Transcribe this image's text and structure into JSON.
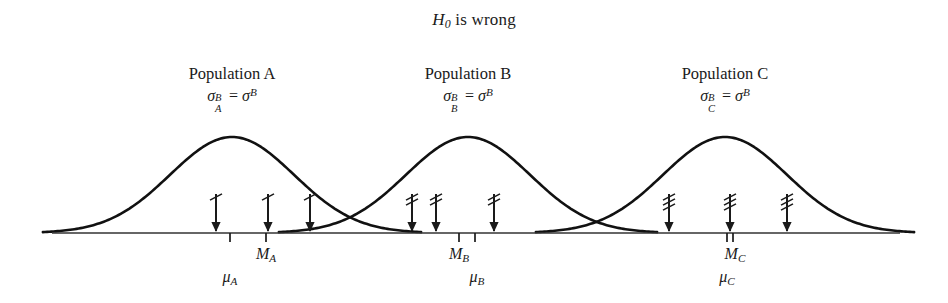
{
  "title": {
    "prefix": "H",
    "subscript": "0",
    "suffix": " is wrong"
  },
  "populations": [
    {
      "name": "Population A",
      "sigma_base": "σ",
      "sigma_sup": "B",
      "sigma_sub": "A",
      "equals": "=",
      "sigma_right_base": "σ",
      "sigma_right_sup": "B",
      "mu_label": "μ",
      "mu_sub": "A",
      "m_label": "M",
      "m_sub": "A",
      "peak_x": 232,
      "mu_x": 230,
      "m_x": 266,
      "arrow_x": [
        216,
        268,
        310
      ],
      "arrow_hatches": 1
    },
    {
      "name": "Population B",
      "sigma_base": "σ",
      "sigma_sup": "B",
      "sigma_sub": "B",
      "equals": "=",
      "sigma_right_base": "σ",
      "sigma_right_sup": "B",
      "mu_label": "μ",
      "mu_sub": "B",
      "m_label": "M",
      "m_sub": "B",
      "peak_x": 468,
      "mu_x": 475,
      "m_x": 459,
      "arrow_x": [
        412,
        436,
        494
      ],
      "arrow_hatches": 2
    },
    {
      "name": "Population C",
      "sigma_base": "σ",
      "sigma_sup": "B",
      "sigma_sub": "C",
      "equals": "=",
      "sigma_right_base": "σ",
      "sigma_right_sup": "B",
      "mu_label": "μ",
      "mu_sub": "C",
      "m_label": "M",
      "m_sub": "C",
      "peak_x": 725,
      "mu_x": 727,
      "m_x": 733,
      "arrow_x": [
        669,
        730,
        787
      ],
      "arrow_hatches": 3
    }
  ],
  "chart_data": {
    "type": "line",
    "title": "H0 is wrong",
    "xlabel": "",
    "ylabel": "",
    "grid": false,
    "legend": "none",
    "baseline_y": 233,
    "axis_x_range": [
      52,
      900
    ],
    "curve_amplitude": 96,
    "curve_sigma": 62,
    "series": [
      {
        "name": "Population A",
        "mean_x": 232,
        "sigma": 62,
        "peak_y": 137,
        "sample_arrows_x": [
          216,
          268,
          310
        ],
        "mu_tick_x": 230,
        "median_tick_x": 266
      },
      {
        "name": "Population B",
        "mean_x": 468,
        "sigma": 62,
        "peak_y": 137,
        "sample_arrows_x": [
          412,
          436,
          494
        ],
        "mu_tick_x": 475,
        "median_tick_x": 459
      },
      {
        "name": "Population C",
        "mean_x": 725,
        "sigma": 62,
        "peak_y": 137,
        "sample_arrows_x": [
          669,
          730,
          787
        ],
        "mu_tick_x": 727,
        "median_tick_x": 733
      }
    ],
    "annotations": [
      "σ_A^B = σ^B",
      "σ_B^B = σ^B",
      "σ_C^B = σ^B"
    ]
  },
  "colors": {
    "ink": "#1a1a1a",
    "curve": "#111111",
    "axis": "#333333",
    "background": "#ffffff"
  }
}
